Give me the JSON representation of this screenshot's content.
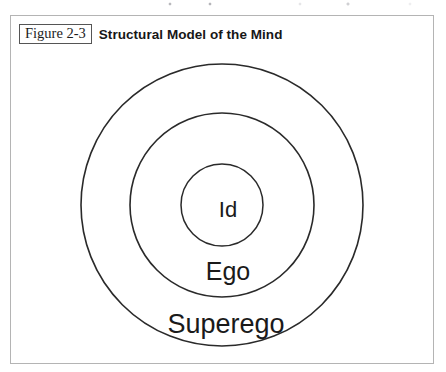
{
  "figure": {
    "number_label": "Figure 2-3",
    "title": "Structural Model of the Mind"
  },
  "diagram": {
    "type": "concentric-circles",
    "rings": [
      {
        "name": "superego",
        "label": "Superego",
        "level": 1,
        "diameter_px": 283,
        "label_position": "bottom-inside"
      },
      {
        "name": "ego",
        "label": "Ego",
        "level": 2,
        "diameter_px": 184,
        "label_position": "bottom-inside"
      },
      {
        "name": "id",
        "label": "Id",
        "level": 3,
        "diameter_px": 82,
        "label_position": "center"
      }
    ],
    "center": {
      "x": 211,
      "y": 189
    },
    "stroke_color": "#2a2a2a",
    "fill_color": "#ffffff",
    "frame_color": "#b4b4b4"
  }
}
